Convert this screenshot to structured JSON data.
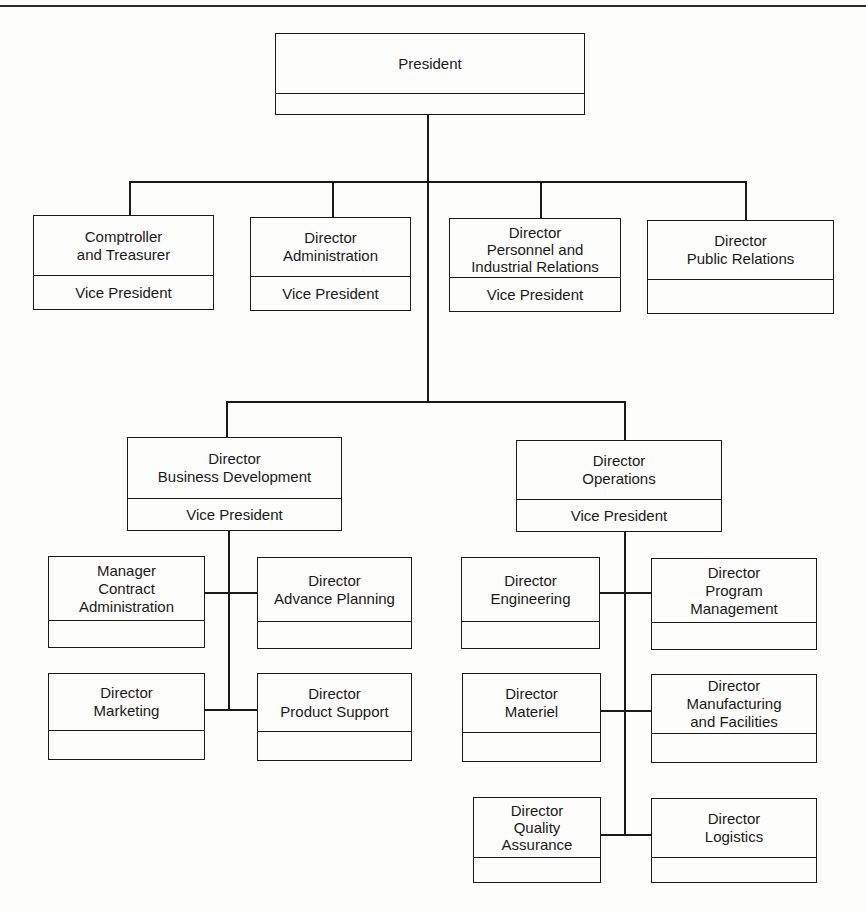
{
  "chart": {
    "type": "org-chart",
    "line_color": "#1a1a1a",
    "background": "#fdfdfb"
  },
  "president": {
    "title_lines": [
      "President"
    ],
    "subtitle": ""
  },
  "staff": [
    {
      "title_lines": [
        "Comptroller",
        "and Treasurer"
      ],
      "subtitle": "Vice President"
    },
    {
      "title_lines": [
        "Director",
        "Administration"
      ],
      "subtitle": "Vice President"
    },
    {
      "title_lines": [
        "Director",
        "Personnel and",
        "Industrial Relations"
      ],
      "subtitle": "Vice President"
    },
    {
      "title_lines": [
        "Director",
        "Public Relations"
      ],
      "subtitle": ""
    }
  ],
  "divisions": [
    {
      "title_lines": [
        "Director",
        "Business Development"
      ],
      "subtitle": "Vice President",
      "reports": [
        {
          "title_lines": [
            "Manager",
            "Contract",
            "Administration"
          ],
          "subtitle": ""
        },
        {
          "title_lines": [
            "Director",
            "Advance Planning"
          ],
          "subtitle": ""
        },
        {
          "title_lines": [
            "Director",
            "Marketing"
          ],
          "subtitle": ""
        },
        {
          "title_lines": [
            "Director",
            "Product Support"
          ],
          "subtitle": ""
        }
      ]
    },
    {
      "title_lines": [
        "Director",
        "Operations"
      ],
      "subtitle": "Vice President",
      "reports": [
        {
          "title_lines": [
            "Director",
            "Engineering"
          ],
          "subtitle": ""
        },
        {
          "title_lines": [
            "Director",
            "Program",
            "Management"
          ],
          "subtitle": ""
        },
        {
          "title_lines": [
            "Director",
            "Materiel"
          ],
          "subtitle": ""
        },
        {
          "title_lines": [
            "Director",
            "Manufacturing",
            "and Facilities"
          ],
          "subtitle": ""
        },
        {
          "title_lines": [
            "Director",
            "Quality",
            "Assurance"
          ],
          "subtitle": ""
        },
        {
          "title_lines": [
            "Director",
            "Logistics"
          ],
          "subtitle": ""
        }
      ]
    }
  ]
}
